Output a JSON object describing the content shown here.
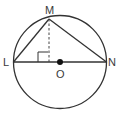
{
  "diagram": {
    "type": "circle-geometry",
    "labels": {
      "top_vertex": "M",
      "left_endpoint": "L",
      "right_endpoint": "N",
      "center": "O"
    },
    "elements": {
      "circle": "circle with center O",
      "diameter": "LN",
      "chords": [
        "LM",
        "MN"
      ],
      "altitude": "dashed perpendicular from M to LN",
      "right_angle_marker": "at foot of altitude"
    },
    "colors": {
      "stroke": "#333333",
      "background": "#ffffff"
    }
  }
}
